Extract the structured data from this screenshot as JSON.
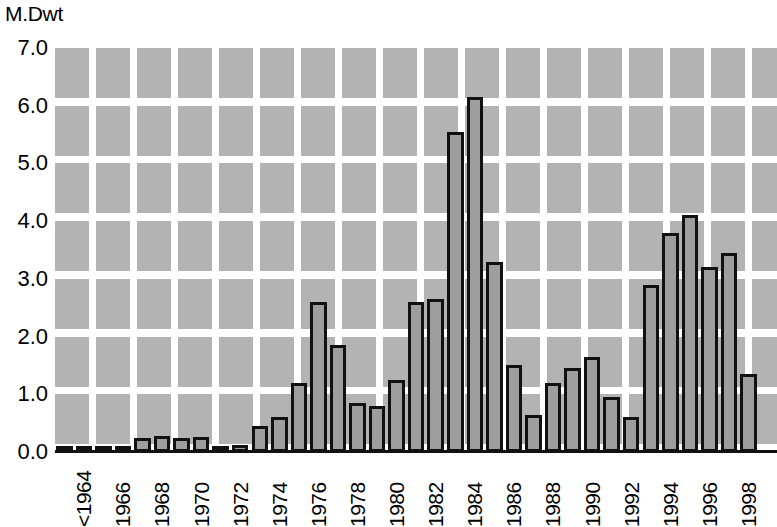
{
  "chart_data": {
    "type": "bar",
    "title": "",
    "subtitle": "",
    "xlabel": "",
    "ylabel": "M.Dwt",
    "ylim": [
      0.0,
      7.0
    ],
    "ytick_labels": [
      "0.0",
      "1.0",
      "2.0",
      "3.0",
      "4.0",
      "5.0",
      "6.0",
      "7.0"
    ],
    "ytick_values": [
      0.0,
      1.0,
      2.0,
      3.0,
      4.0,
      5.0,
      6.0,
      7.0
    ],
    "grid": true,
    "grid_style": "tiled-gray-blocks",
    "legend": null,
    "legend_position": "none",
    "bar_fill_color": "#9e9e9e",
    "bar_edge_color": "#111111",
    "plot_background_color": "#b3b3b3",
    "categories": [
      "<1964",
      "1965",
      "1966",
      "1967",
      "1968",
      "1969",
      "1970",
      "1971",
      "1972",
      "1973",
      "1974",
      "1975",
      "1976",
      "1977",
      "1978",
      "1979",
      "1980",
      "1981",
      "1982",
      "1983",
      "1984",
      "1985",
      "1986",
      "1987",
      "1988",
      "1989",
      "1990",
      "1991",
      "1992",
      "1993",
      "1994",
      "1995",
      "1996",
      "1997",
      "1998",
      "1999"
    ],
    "values": [
      0.08,
      0.07,
      0.07,
      0.07,
      0.25,
      0.28,
      0.25,
      0.26,
      0.1,
      0.12,
      0.45,
      0.6,
      1.2,
      2.6,
      1.85,
      0.85,
      0.8,
      1.25,
      2.6,
      2.65,
      5.55,
      6.15,
      3.3,
      1.5,
      0.65,
      1.2,
      1.45,
      1.65,
      0.95,
      0.6,
      2.9,
      3.8,
      4.1,
      3.2,
      3.45,
      1.35
    ],
    "xtick_labels": [
      "<1964",
      "1966",
      "1968",
      "1970",
      "1972",
      "1974",
      "1976",
      "1978",
      "1980",
      "1982",
      "1984",
      "1986",
      "1988",
      "1990",
      "1992",
      "1994",
      "1996",
      "1998"
    ],
    "xtick_indices": [
      0,
      2,
      4,
      6,
      8,
      10,
      12,
      14,
      16,
      18,
      20,
      22,
      24,
      26,
      28,
      30,
      32,
      34
    ],
    "xtick_rotation": 90
  }
}
